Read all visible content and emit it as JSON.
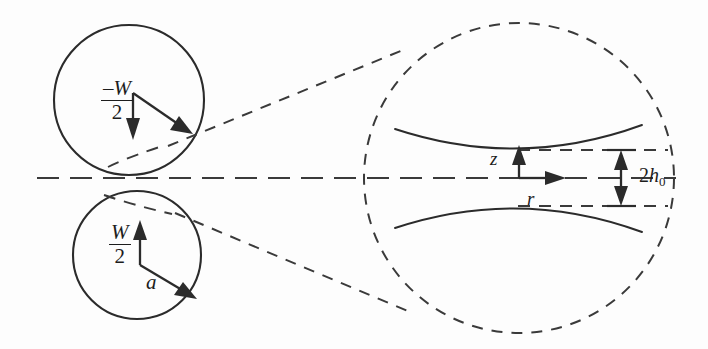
{
  "figure": {
    "background_color": "#fdfdfd",
    "line_color": "#2b2b2b",
    "width": 708,
    "height": 349
  },
  "labels": {
    "force_up_numerator": "W",
    "force_up_denominator": "2",
    "force_down_numerator": "–W",
    "force_down_denominator": "2",
    "radius": "a",
    "axial_coord": "z",
    "radial_coord": "r",
    "gap_prefix": "2",
    "gap_symbol": "h",
    "gap_subscript": "0",
    "gap_full": "2h0"
  },
  "elements": {
    "top_sphere": "upper-sphere-outline",
    "bottom_sphere": "lower-sphere-outline",
    "magnified_circle": "magnified-region-circle",
    "centerline": "symmetry-axis",
    "connector_upper": "magnifier-connector-upper",
    "connector_lower": "magnifier-connector-lower",
    "upper_surface": "upper-sphere-surface-curve",
    "lower_surface": "lower-sphere-surface-curve",
    "gap_dimension": "gap-dimension-arrow"
  },
  "geometry": {
    "top_sphere_center_x": 129,
    "top_sphere_center_y": 100,
    "top_sphere_radius": 75,
    "bottom_sphere_center_x": 137,
    "bottom_sphere_center_y": 255,
    "bottom_sphere_radius": 64,
    "magnified_circle_center_x": 519,
    "magnified_circle_center_y": 178,
    "magnified_circle_radius": 155,
    "centerline_y": 178,
    "centerline_x_start": 37,
    "centerline_x_end": 676
  }
}
